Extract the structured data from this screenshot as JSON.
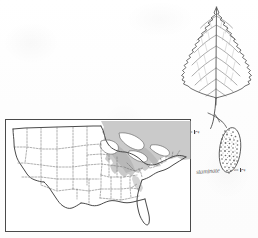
{
  "plate": {
    "title": "Botanical species plate",
    "background_color": "#fefefe",
    "ink_color": "#3a3a3a",
    "range_shading_color": "#a9a9a9"
  },
  "leaf": {
    "name": "leaf-illustration",
    "caption": "Leaf, ovate with acuminate tip, doubly serrate margin, pinnate venation, long petiole",
    "scale_label": "1/2",
    "scale_numerator": "1",
    "scale_denominator": "2"
  },
  "catkin": {
    "name": "catkin-illustration",
    "caption": "Pendulous catkin with stippled scaled surface on a slender stalk",
    "scale_label": "1/2",
    "scale_numerator": "1",
    "scale_denominator": "2"
  },
  "annotation": {
    "species_note": "staminate"
  },
  "map": {
    "name": "us-range-map",
    "caption": "Distribution map of the contiguous United States with shaded native range",
    "region_shaded": "Great Lakes, Northeast and northern Appalachians",
    "border_color": "#4a4a4a",
    "state_line_color": "#6e6e6e",
    "shade_color": "#a9a9a9"
  }
}
